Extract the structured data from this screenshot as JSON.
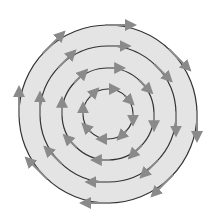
{
  "diagram": {
    "type": "concentric-circles-vector-field",
    "center": [
      108,
      114
    ],
    "colors": {
      "background": "#ffffff",
      "disk_fill": "#e4e4e4",
      "circle_stroke": "#333333",
      "arrow": "#8a8a8a"
    },
    "circles": [
      {
        "radius": 89,
        "arrow_length": 30
      },
      {
        "radius": 68,
        "arrow_length": 24
      },
      {
        "radius": 46,
        "arrow_length": 18
      },
      {
        "radius": 25,
        "arrow_length": 12
      }
    ],
    "arrow_angles_deg": [
      0,
      45,
      90,
      135,
      180,
      225,
      270,
      315
    ],
    "rotation": "clockwise"
  }
}
